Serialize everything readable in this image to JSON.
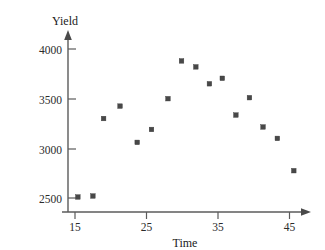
{
  "chart_data": {
    "type": "scatter",
    "title": "",
    "xlabel": "Time",
    "ylabel": "Yield",
    "xlim": [
      12.5,
      48.5
    ],
    "ylim": [
      2350,
      4080
    ],
    "xticks": [
      15,
      25,
      35,
      45
    ],
    "yticks": [
      2500,
      3000,
      3500,
      4000
    ],
    "xtick_labels": [
      "15",
      "25",
      "35",
      "45"
    ],
    "ytick_labels": [
      "2500",
      "3000",
      "3500",
      "4000"
    ],
    "grid": false,
    "legend": "none",
    "marker": "square",
    "marker_color": "#484848",
    "points": [
      {
        "x": 15.4,
        "y": 2510
      },
      {
        "x": 17.5,
        "y": 2520
      },
      {
        "x": 19.0,
        "y": 3300
      },
      {
        "x": 21.3,
        "y": 3425
      },
      {
        "x": 23.7,
        "y": 3060
      },
      {
        "x": 25.7,
        "y": 3190
      },
      {
        "x": 28.0,
        "y": 3500
      },
      {
        "x": 29.9,
        "y": 3880
      },
      {
        "x": 31.9,
        "y": 3820
      },
      {
        "x": 33.8,
        "y": 3650
      },
      {
        "x": 35.6,
        "y": 3705
      },
      {
        "x": 37.5,
        "y": 3335
      },
      {
        "x": 39.4,
        "y": 3510
      },
      {
        "x": 41.3,
        "y": 3215
      },
      {
        "x": 43.3,
        "y": 3100
      },
      {
        "x": 45.6,
        "y": 2775
      }
    ]
  },
  "axes": {
    "y_axis_label": "Yield",
    "x_axis_label": "Time"
  }
}
